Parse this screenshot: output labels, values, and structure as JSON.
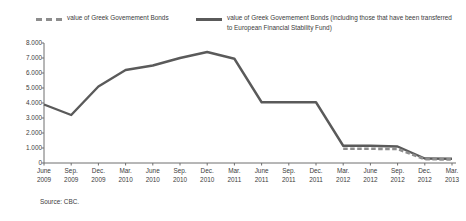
{
  "legend": {
    "entries": [
      {
        "label": "value of Greek Govemement Bonds",
        "style": "dashed",
        "color": "#8d8d8d"
      },
      {
        "label": "value of Greek Govemement Bonds (including those that have been transferred to European Financial Stability Fund)",
        "style": "solid",
        "color": "#5a5a5a"
      }
    ]
  },
  "source": {
    "text": "Source: CBC."
  },
  "chart_data": {
    "type": "line",
    "title": "",
    "subtitle": "",
    "xlabel": "",
    "ylabel": "",
    "ylim": [
      0,
      8000
    ],
    "yticks": [
      0,
      1000,
      2000,
      3000,
      4000,
      5000,
      6000,
      7000,
      8000
    ],
    "ytick_labels": [
      "0",
      "1.000",
      "2.000",
      "3.000",
      "4.000",
      "5.000",
      "6.000",
      "7.000",
      "8.000"
    ],
    "grid": false,
    "legend_position": "top",
    "categories": [
      "June 2009",
      "Sep. 2009",
      "Dec. 2009",
      "Mar. 2010",
      "June 2010",
      "Sep. 2010",
      "Dec. 2010",
      "Mar. 2011",
      "June 2011",
      "Sep. 2011",
      "Dec. 2011",
      "Mar. 2012",
      "June 2012",
      "Sep. 2012",
      "Dec. 2012",
      "Mar. 2013"
    ],
    "xtick_months": [
      "June",
      "Sep.",
      "Dec.",
      "Mar.",
      "June",
      "Sep.",
      "Dec.",
      "Mar.",
      "June",
      "Sep.",
      "Dec.",
      "Mar.",
      "June",
      "Sep.",
      "Dec.",
      "Mar."
    ],
    "xtick_years": [
      "2009",
      "2009",
      "2009",
      "2010",
      "2010",
      "2010",
      "2010",
      "2011",
      "2011",
      "2011",
      "2011",
      "2012",
      "2012",
      "2012",
      "2012",
      "2013"
    ],
    "series": [
      {
        "name": "value of Greek Govemement Bonds (including those that have been transferred to European Financial Stability Fund)",
        "style": "solid",
        "color": "#5a5a5a",
        "values": [
          3900,
          3200,
          5100,
          6200,
          6500,
          7000,
          7400,
          6950,
          4050,
          4050,
          4050,
          1150,
          1150,
          1100,
          300,
          280
        ]
      },
      {
        "name": "value of Greek Govemement Bonds",
        "style": "dashed",
        "color": "#8d8d8d",
        "values": [
          null,
          null,
          null,
          null,
          null,
          null,
          null,
          null,
          null,
          null,
          null,
          950,
          950,
          930,
          250,
          240
        ]
      }
    ]
  }
}
